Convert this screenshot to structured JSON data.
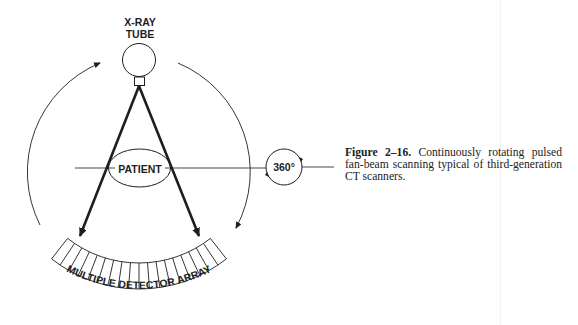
{
  "diagram": {
    "labels": {
      "tube_line1": "X-RAY",
      "tube_line2": "TUBE",
      "patient": "PATIENT",
      "rotation": "360°",
      "detector": "MULTIPLE DETECTOR ARRAY"
    },
    "detector_cells": 18,
    "colors": {
      "ink": "#1e1e1e",
      "background": "#ffffff"
    }
  },
  "caption": {
    "figure_label": "Figure 2–16.",
    "text": "Continuously rotating pulsed fan-beam scanning typical of third-generation CT scanners."
  }
}
